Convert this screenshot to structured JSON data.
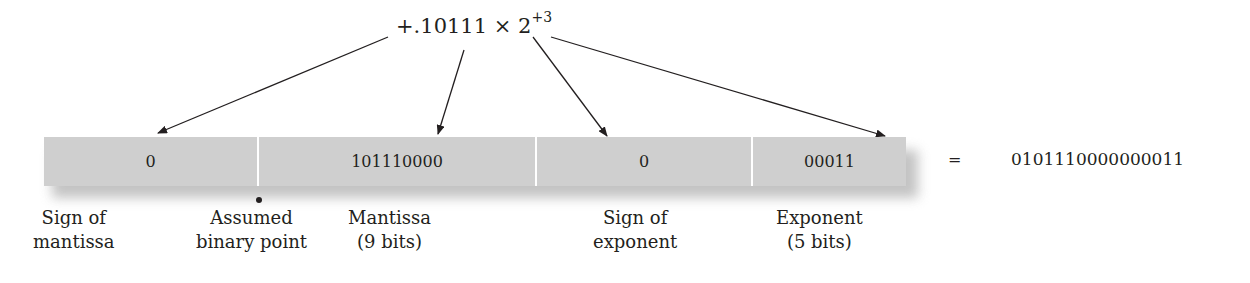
{
  "expression": {
    "sign_and_mantissa": "+.10111",
    "times": "×",
    "base": "2",
    "exponent": "+3"
  },
  "fields": [
    {
      "name": "sign-of-mantissa",
      "value": "0"
    },
    {
      "name": "mantissa",
      "value": "101110000"
    },
    {
      "name": "sign-of-exponent",
      "value": "0"
    },
    {
      "name": "exponent",
      "value": "00011"
    }
  ],
  "equals": "=",
  "result": "0101110000000011",
  "labels": {
    "sign_of_mantissa": {
      "line1": "Sign of",
      "line2": "mantissa"
    },
    "binary_point": {
      "line1": "Assumed",
      "line2": "binary point"
    },
    "mantissa": {
      "line1": "Mantissa",
      "line2": "(9 bits)"
    },
    "sign_of_exponent": {
      "line1": "Sign of",
      "line2": "exponent"
    },
    "exponent": {
      "line1": "Exponent",
      "line2": "(5 bits)"
    }
  },
  "colors": {
    "field_fill": "#cfcfcf",
    "divider": "#ffffff",
    "text": "#231f20"
  }
}
